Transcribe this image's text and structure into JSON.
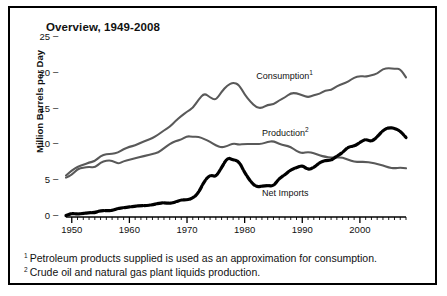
{
  "figure": {
    "title": "Overview, 1949-2008",
    "border_color": "#000000",
    "background": "#ffffff"
  },
  "axes": {
    "ylabel": "Million Barrels per Day",
    "ytick_labels": [
      "0",
      "5",
      "10",
      "15",
      "20",
      "25"
    ],
    "ytick_values": [
      0,
      5,
      10,
      15,
      20,
      25
    ],
    "ytick_dash": "–",
    "xtick_labels": [
      "1950",
      "1960",
      "1970",
      "1980",
      "1990",
      "2000"
    ],
    "xtick_values": [
      1950,
      1960,
      1970,
      1980,
      1990,
      2000
    ],
    "xlim": [
      1949,
      2008
    ],
    "ylim": [
      0,
      25
    ]
  },
  "series_labels": {
    "consumption": "Consumption",
    "consumption_marker": "1",
    "production": "Production",
    "production_marker": "2",
    "net_imports": "Net Imports"
  },
  "footnotes": [
    {
      "marker": "1",
      "text": "Petroleum products supplied is used as an approximation for consumption."
    },
    {
      "marker": "2",
      "text": "Crude oil and natural gas plant liquids production."
    }
  ],
  "colors": {
    "consumption_line": "#595959",
    "production_line": "#595959",
    "net_imports_line": "#000000",
    "axis": "#000000",
    "text": "#111111"
  },
  "chart_data": {
    "type": "line",
    "title": "Overview, 1949-2008",
    "xlabel": "",
    "ylabel": "Million Barrels per Day",
    "xlim": [
      1949,
      2008
    ],
    "ylim": [
      0,
      25
    ],
    "grid": false,
    "legend_position": "inline-annotations",
    "x": [
      1949,
      1950,
      1951,
      1952,
      1953,
      1954,
      1955,
      1956,
      1957,
      1958,
      1959,
      1960,
      1961,
      1962,
      1963,
      1964,
      1965,
      1966,
      1967,
      1968,
      1969,
      1970,
      1971,
      1972,
      1973,
      1974,
      1975,
      1976,
      1977,
      1978,
      1979,
      1980,
      1981,
      1982,
      1983,
      1984,
      1985,
      1986,
      1987,
      1988,
      1989,
      1990,
      1991,
      1992,
      1993,
      1994,
      1995,
      1996,
      1997,
      1998,
      1999,
      2000,
      2001,
      2002,
      2003,
      2004,
      2005,
      2006,
      2007,
      2008
    ],
    "series": [
      {
        "name": "Consumption",
        "color": "#595959",
        "style": "solid",
        "values": [
          5.8,
          6.5,
          7.0,
          7.3,
          7.6,
          7.8,
          8.5,
          8.8,
          8.8,
          9.0,
          9.5,
          9.8,
          10.0,
          10.4,
          10.7,
          11.0,
          11.5,
          12.1,
          12.6,
          13.4,
          14.1,
          14.7,
          15.2,
          16.4,
          17.3,
          16.7,
          16.3,
          17.5,
          18.4,
          18.8,
          18.5,
          17.1,
          16.1,
          15.3,
          15.2,
          15.7,
          15.7,
          16.3,
          16.7,
          17.3,
          17.3,
          17.0,
          16.7,
          17.0,
          17.2,
          17.7,
          17.7,
          18.3,
          18.6,
          18.9,
          19.5,
          19.7,
          19.6,
          19.8,
          20.0,
          20.7,
          20.8,
          20.7,
          20.7,
          19.5
        ],
        "label_position": {
          "x": 1982,
          "y": 19.6
        }
      },
      {
        "name": "Production",
        "color": "#595959",
        "style": "solid",
        "values": [
          5.5,
          5.9,
          6.7,
          6.9,
          7.0,
          6.9,
          7.6,
          7.9,
          7.9,
          7.4,
          7.8,
          8.0,
          8.2,
          8.4,
          8.6,
          8.8,
          9.0,
          9.6,
          10.2,
          10.6,
          10.8,
          11.3,
          11.2,
          11.2,
          10.9,
          10.5,
          10.0,
          9.7,
          9.9,
          10.3,
          10.1,
          10.2,
          10.2,
          10.2,
          10.2,
          10.5,
          10.6,
          10.2,
          10.0,
          9.8,
          9.2,
          8.9,
          9.1,
          8.9,
          8.6,
          8.4,
          8.3,
          8.3,
          8.3,
          8.0,
          7.7,
          7.7,
          7.7,
          7.6,
          7.4,
          7.2,
          6.9,
          6.8,
          6.9,
          6.8
        ],
        "label_position": {
          "x": 1983,
          "y": 11.6
        }
      },
      {
        "name": "Net Imports",
        "color": "#000000",
        "style": "bold-dashed",
        "values": [
          0.2,
          0.5,
          0.4,
          0.5,
          0.6,
          0.6,
          0.9,
          0.9,
          0.9,
          1.2,
          1.3,
          1.4,
          1.5,
          1.6,
          1.6,
          1.7,
          1.9,
          2.0,
          1.9,
          2.1,
          2.4,
          2.4,
          2.6,
          3.4,
          5.0,
          5.9,
          5.6,
          6.9,
          8.3,
          8.0,
          7.8,
          6.2,
          5.0,
          4.2,
          4.3,
          4.4,
          4.3,
          5.4,
          5.9,
          6.6,
          6.9,
          7.2,
          6.6,
          6.9,
          7.6,
          7.9,
          7.9,
          8.5,
          9.0,
          9.8,
          9.9,
          10.4,
          10.9,
          10.5,
          11.2,
          12.1,
          12.5,
          12.4,
          12.0,
          11.1
        ],
        "label_position": {
          "x": 1983,
          "y": 3.2
        }
      }
    ]
  }
}
